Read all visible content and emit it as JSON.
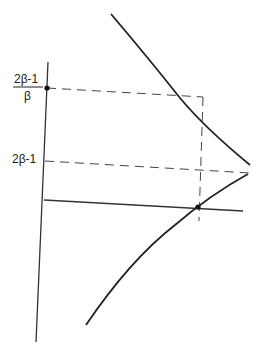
{
  "diagram": {
    "labels": {
      "upper_numerator": "2β-1",
      "upper_denominator": "β",
      "lower": "2β-1"
    },
    "colors": {
      "ink": "#222222",
      "dash": "#444444",
      "background": "#ffffff"
    },
    "elements": [
      "vertical-axis",
      "horizontal-axis",
      "upper-hyperbola-branch",
      "lower-hyperbola-branch",
      "dashed-line-fraction-level",
      "dashed-line-2beta-minus-1-level",
      "vertical-dashed-line",
      "axis-point",
      "intersection-point"
    ]
  }
}
